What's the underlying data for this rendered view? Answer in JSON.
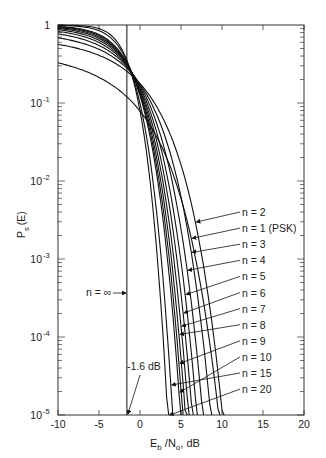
{
  "chart_data": {
    "type": "line",
    "title": "",
    "xlabel": "E_b /N_o, dB",
    "ylabel": "P_s(E)",
    "xlim": [
      -10,
      20
    ],
    "ylim": [
      1e-05,
      1
    ],
    "yscale": "log",
    "grid": false,
    "x_ticks": [
      "-10",
      "-5",
      "0",
      "5",
      "10",
      "15",
      "20"
    ],
    "y_ticks": [
      "1",
      "10^-1",
      "10^-2",
      "10^-3",
      "10^-4",
      "10^-5"
    ],
    "series": [
      {
        "name": "n = 1 (PSK)",
        "k": 1
      },
      {
        "name": "n = 2",
        "k": 2
      },
      {
        "name": "n = 3",
        "k": 3
      },
      {
        "name": "n = 4",
        "k": 4
      },
      {
        "name": "n = 5",
        "k": 5
      },
      {
        "name": "n = 6",
        "k": 6
      },
      {
        "name": "n = 7",
        "k": 7
      },
      {
        "name": "n = 8",
        "k": 8
      },
      {
        "name": "n = 9",
        "k": 9
      },
      {
        "name": "n = 10",
        "k": 10
      },
      {
        "name": "n = 15",
        "k": 15
      },
      {
        "name": "n = 20",
        "k": 20
      }
    ],
    "limit_line": {
      "name": "n = ∞",
      "x": -1.6
    },
    "annotations": [
      {
        "text": "n = ∞",
        "note": "vertical Shannon-limit line"
      },
      {
        "text": "-1.6 dB",
        "note": "arrow to x-axis at -1.6 dB"
      }
    ],
    "approx_ebno_at_1e-5_dB": {
      "n = 1 (PSK)": 12.6,
      "n = 2": 10.0,
      "n = 3": 8.6,
      "n = 4": 7.8,
      "n = 5": 7.2,
      "n = 6": 6.8,
      "n = 7": 6.4,
      "n = 8": 6.1,
      "n = 9": 5.9,
      "n = 10": 5.7,
      "n = 15": 5.0,
      "n = 20": 4.6
    }
  },
  "labels": {
    "xlabel_main": "E",
    "xlabel_sub1": "b",
    "xlabel_mid": " /N",
    "xlabel_sub2": "o",
    "xlabel_end": ", dB",
    "ylabel_main": "P",
    "ylabel_sub": "s",
    "ylabel_end": "(E)",
    "ninf": "n = ∞",
    "shannon": "-1.6 dB"
  },
  "legend_order": [
    "n = 2",
    "n = 1 (PSK)",
    "n = 3",
    "n = 4",
    "n = 5",
    "n = 6",
    "n = 7",
    "n = 8",
    "n = 9",
    "n = 10",
    "n = 15",
    "n = 20"
  ]
}
